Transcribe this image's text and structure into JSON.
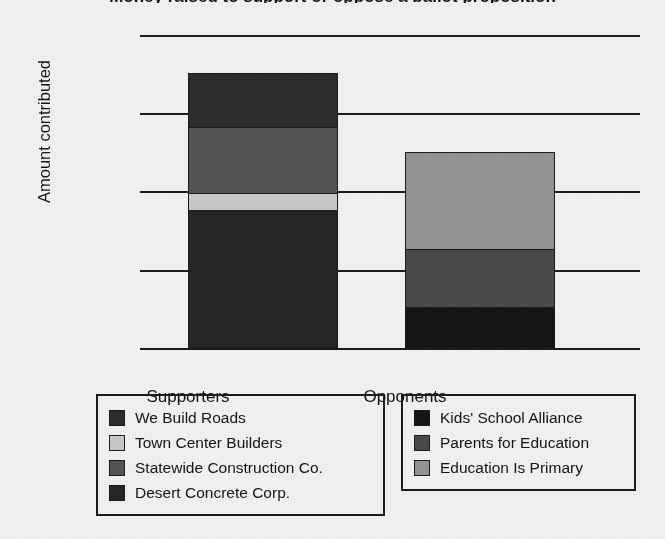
{
  "chart_data": {
    "type": "bar",
    "subtype": "stacked-bar",
    "title": "Money raised to support or oppose a ballot proposition",
    "xlabel": "",
    "ylabel": "Amount contributed",
    "ylim": [
      0,
      800000
    ],
    "y_ticks": [
      "$0",
      "$200,000",
      "$400,000",
      "$600,000",
      "$800,000"
    ],
    "y_tick_values": [
      0,
      200000,
      400000,
      600000,
      800000
    ],
    "grid": true,
    "legend_position": "bottom",
    "categories": [
      "Supporters",
      "Opponents"
    ],
    "totals": [
      700000,
      500000
    ],
    "series": [
      {
        "name": "Desert Concrete Corp.",
        "category": "Supporters",
        "value": 350000,
        "color": "#262626"
      },
      {
        "name": "Town Center Builders",
        "category": "Supporters",
        "value": 45000,
        "color": "#c9c9c9"
      },
      {
        "name": "Statewide Construction Co.",
        "category": "Supporters",
        "value": 170000,
        "color": "#545454"
      },
      {
        "name": "We Build Roads",
        "category": "Supporters",
        "value": 135000,
        "color": "#2d2d2d"
      },
      {
        "name": "Kids' School Alliance",
        "category": "Opponents",
        "value": 105000,
        "color": "#151515"
      },
      {
        "name": "Parents for Education",
        "category": "Opponents",
        "value": 150000,
        "color": "#4a4a4a"
      },
      {
        "name": "Education Is Primary",
        "category": "Opponents",
        "value": 245000,
        "color": "#949494"
      }
    ]
  },
  "axis": {
    "y_title": "Amount contributed",
    "ticks": [
      {
        "label": "$800,000",
        "top": 5
      },
      {
        "label": "$600,000",
        "top": 83
      },
      {
        "label": "$400,000",
        "top": 161
      },
      {
        "label": "$200,000",
        "top": 240
      },
      {
        "label": "$0",
        "top": 318
      }
    ]
  },
  "bars": [
    {
      "name": "supporters",
      "label": "Supporters",
      "left": 48,
      "label_left": -62,
      "segments": [
        {
          "name": "We Build Roads",
          "height": 53,
          "color": "#2d2d2d"
        },
        {
          "name": "Statewide Construction Co.",
          "height": 66,
          "color": "#545454"
        },
        {
          "name": "Town Center Builders",
          "height": 17,
          "color": "#c9c9c9"
        },
        {
          "name": "Desert Concrete Corp.",
          "height": 137,
          "color": "#262626"
        }
      ]
    },
    {
      "name": "opponents",
      "label": "Opponents",
      "left": 265,
      "label_left": 155,
      "segments": [
        {
          "name": "Education Is Primary",
          "height": 96,
          "color": "#949494"
        },
        {
          "name": "Parents for Education",
          "height": 58,
          "color": "#4a4a4a"
        },
        {
          "name": "Kids' School Alliance",
          "height": 40,
          "color": "#151515"
        }
      ]
    }
  ],
  "legends": {
    "supporters": {
      "name": "supporters-legend",
      "items": [
        {
          "label": "We Build Roads",
          "color": "#2d2d2d"
        },
        {
          "label": "Town Center Builders",
          "color": "#c9c9c9"
        },
        {
          "label": "Statewide Construction Co.",
          "color": "#545454"
        },
        {
          "label": "Desert Concrete Corp.",
          "color": "#262626"
        }
      ]
    },
    "opponents": {
      "name": "opponents-legend",
      "items": [
        {
          "label": "Kids' School Alliance",
          "color": "#151515"
        },
        {
          "label": "Parents for Education",
          "color": "#4a4a4a"
        },
        {
          "label": "Education Is Primary",
          "color": "#949494"
        }
      ]
    }
  }
}
